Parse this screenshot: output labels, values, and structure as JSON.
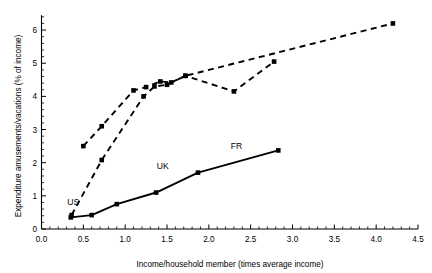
{
  "chart_data": {
    "type": "line",
    "title": "",
    "xlabel": "Income/household member (times average income)",
    "ylabel": "Expenditure amusements/vacations (% of income)",
    "xlim": [
      0.0,
      4.5
    ],
    "ylim": [
      0,
      6.5
    ],
    "xticks": [
      "0.0",
      "0.5",
      "1.0",
      "1.5",
      "2.0",
      "2.5",
      "3.0",
      "3.5",
      "4.0",
      "4.5"
    ],
    "xtick_values": [
      0.0,
      0.5,
      1.0,
      1.5,
      2.0,
      2.5,
      3.0,
      3.5,
      4.0,
      4.5
    ],
    "yticks": [
      "0",
      "1",
      "2",
      "3",
      "4",
      "5",
      "6"
    ],
    "ytick_values": [
      0,
      1,
      2,
      3,
      4,
      5,
      6
    ],
    "grid": false,
    "legend": "none",
    "annotations": [
      {
        "text": "US",
        "x": 0.38,
        "y": 0.72
      },
      {
        "text": "UK",
        "x": 1.45,
        "y": 1.82
      },
      {
        "text": "FR",
        "x": 2.33,
        "y": 2.42
      }
    ],
    "series": [
      {
        "name": "solid-series",
        "style": "solid",
        "marker": "square",
        "x": [
          0.35,
          0.6,
          0.9,
          1.37,
          1.87,
          2.83
        ],
        "y": [
          0.35,
          0.42,
          0.75,
          1.1,
          1.7,
          2.37
        ]
      },
      {
        "name": "dashed-series-upper",
        "style": "dashed",
        "marker": "square",
        "x": [
          0.5,
          0.72,
          1.1,
          1.25,
          1.42,
          1.55,
          1.72,
          2.3,
          2.78
        ],
        "y": [
          2.5,
          3.1,
          4.18,
          4.28,
          4.45,
          4.42,
          4.62,
          4.15,
          5.05
        ]
      },
      {
        "name": "dashed-series-lower",
        "style": "dashed",
        "marker": "square",
        "x": [
          0.36,
          0.72,
          1.22,
          1.35,
          1.5,
          1.72,
          4.2
        ],
        "y": [
          0.42,
          2.08,
          4.0,
          4.3,
          4.35,
          4.62,
          6.2
        ]
      }
    ]
  },
  "figure": {
    "background_color": "#ffffff",
    "line_color": "#000000"
  }
}
